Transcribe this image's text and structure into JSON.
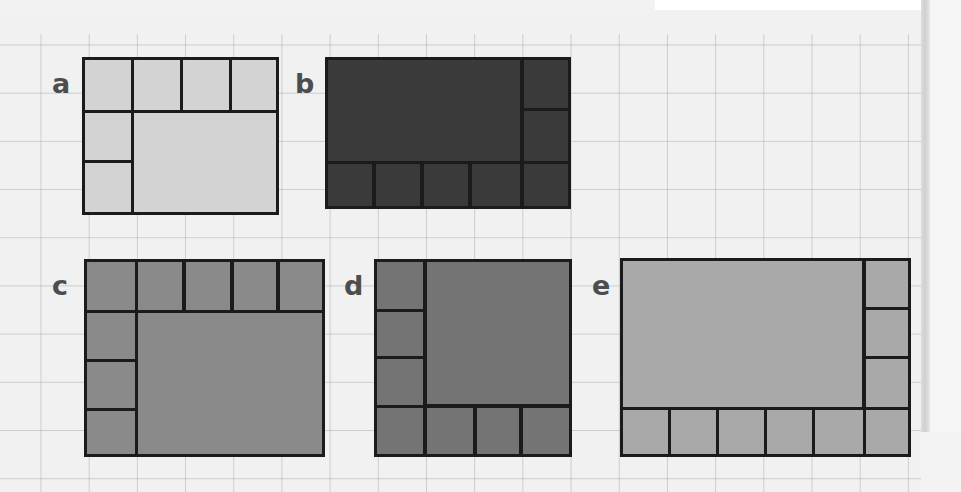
{
  "page": {
    "background_color": "#f1f1f1",
    "grid_color": "#9a9a9f",
    "grid_spacing_px": 48,
    "line_color": "#1b1b1b",
    "edge_color": "#cfcfcf"
  },
  "figures": [
    {
      "id": "a",
      "label": "a",
      "fill_color": "#d3d3d3",
      "bounds": {
        "x": 82,
        "y": 57,
        "w": 197,
        "h": 158
      },
      "top_row_cells": 4,
      "left_column_cells": 2,
      "bottom_row_cells": 0,
      "right_column_cells": 0,
      "core_rect": {
        "x": 133,
        "y": 110,
        "w": 146,
        "h": 105
      }
    },
    {
      "id": "b",
      "label": "b",
      "fill_color": "#3a3a3a",
      "bounds": {
        "x": 325,
        "y": 57,
        "w": 246,
        "h": 152
      },
      "top_row_cells": 0,
      "left_column_cells": 0,
      "bottom_row_cells": 5,
      "right_column_cells": 2,
      "core_rect": {
        "x": 325,
        "y": 57,
        "w": 196,
        "h": 106
      }
    },
    {
      "id": "c",
      "label": "c",
      "fill_color": "#8a8a8a",
      "bounds": {
        "x": 84,
        "y": 259,
        "w": 241,
        "h": 198
      },
      "top_row_cells": 5,
      "left_column_cells": 3,
      "bottom_row_cells": 0,
      "right_column_cells": 0,
      "core_rect": {
        "x": 137,
        "y": 311,
        "w": 188,
        "h": 146
      }
    },
    {
      "id": "d",
      "label": "d",
      "fill_color": "#747474",
      "bounds": {
        "x": 374,
        "y": 259,
        "w": 198,
        "h": 198
      },
      "top_row_cells": 0,
      "left_column_cells": 3,
      "bottom_row_cells": 4,
      "right_column_cells": 0,
      "core_rect": {
        "x": 424,
        "y": 259,
        "w": 148,
        "h": 147
      }
    },
    {
      "id": "e",
      "label": "e",
      "fill_color": "#a9a9a9",
      "bounds": {
        "x": 620,
        "y": 258,
        "w": 291,
        "h": 199
      },
      "top_row_cells": 0,
      "left_column_cells": 0,
      "bottom_row_cells": 6,
      "right_column_cells": 3,
      "core_rect": {
        "x": 620,
        "y": 258,
        "w": 243,
        "h": 149
      }
    }
  ],
  "labels": {
    "a": "a",
    "b": "b",
    "c": "c",
    "d": "d",
    "e": "e"
  }
}
